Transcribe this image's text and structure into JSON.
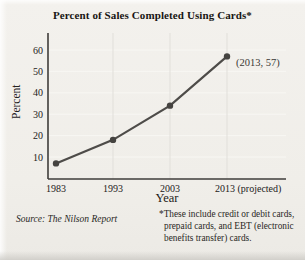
{
  "source": "Source: The Nilson Report",
  "footnote": {
    "marker": "*",
    "lines": [
      "These include credit or debit cards,",
      "prepaid cards, and EBT (electronic",
      "benefits transfer) cards."
    ]
  },
  "chart_data": {
    "type": "line",
    "title": "Percent of Sales Completed Using Cards*",
    "xlabel": "Year",
    "ylabel": "Percent",
    "x": [
      1983,
      1993,
      2003,
      2013
    ],
    "x_tick_labels": [
      "1983",
      "1993",
      "2003",
      "2013 (projected)"
    ],
    "values": [
      7,
      18,
      34,
      57
    ],
    "y_ticks": [
      10,
      20,
      30,
      40,
      50,
      60
    ],
    "ylim": [
      0,
      68
    ],
    "grid": true,
    "legend": "none",
    "annotation": {
      "text": "(2013, 57)",
      "x": 2013,
      "y": 57
    },
    "colors": {
      "line": "#4e4c49",
      "point": "#454340",
      "axis": "#3f3d3a",
      "grid_vertical": "#e1dfda",
      "grid_horizontal": "#f8f7f3",
      "tick_text": "#232120",
      "annotation_text": "#3a3835"
    }
  }
}
